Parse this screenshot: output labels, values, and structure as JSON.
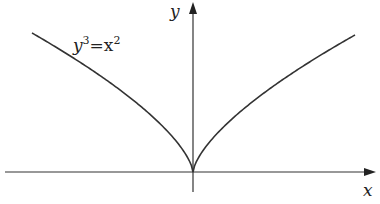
{
  "figure": {
    "curve_label": {
      "base": "y",
      "exp": "3",
      "eq": "=x",
      "exp2": "2"
    },
    "x_axis_label": "x",
    "y_axis_label": "y",
    "stroke_color": "#333333"
  },
  "chart_data": {
    "type": "line",
    "title": "",
    "equation": "y^3 = x^2",
    "xlabel": "x",
    "ylabel": "y",
    "grid": false,
    "legend": "inline label upper-left",
    "series": [
      {
        "name": "y^3=x^2",
        "x": [
          -1,
          -0.5,
          -0.1,
          0,
          0.1,
          0.5,
          1
        ],
        "y": [
          1,
          0.63,
          0.215,
          0,
          0.215,
          0.63,
          1
        ]
      }
    ]
  }
}
